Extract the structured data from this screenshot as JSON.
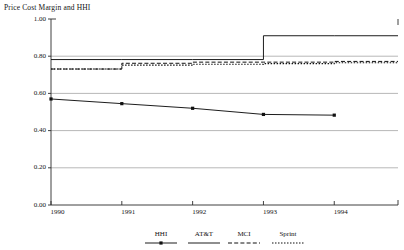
{
  "chart_data": {
    "type": "line",
    "title": "Price Cost Margin and HHI",
    "xlabel": "",
    "ylabel": "",
    "x": [
      1990,
      1991,
      1992,
      1993,
      1994
    ],
    "xlim": [
      1990,
      1994.9
    ],
    "ylim": [
      0.0,
      1.0
    ],
    "ytick_labels": [
      "0.00",
      "0.20",
      "0.40",
      "0.60",
      "0.80",
      "1.00"
    ],
    "ytick_values": [
      0.0,
      0.2,
      0.4,
      0.6,
      0.8,
      1.0
    ],
    "xtick_labels": [
      "1990",
      "1991",
      "1992",
      "1993",
      "1994"
    ],
    "xtick_values": [
      1990,
      1991,
      1992,
      1993,
      1994
    ],
    "grid": true,
    "legend_position": "bottom",
    "series": [
      {
        "name": "HHI",
        "style": "solid-markers",
        "marker": "square",
        "step": false,
        "values": [
          0.57,
          0.545,
          0.52,
          0.487,
          0.483
        ]
      },
      {
        "name": "AT&T",
        "style": "solid",
        "marker": "none",
        "step": true,
        "values": [
          0.782,
          0.782,
          0.782,
          0.91,
          0.91
        ]
      },
      {
        "name": "MCI",
        "style": "dashed",
        "marker": "none",
        "step": true,
        "values": [
          0.731,
          0.762,
          0.768,
          0.768,
          0.772
        ]
      },
      {
        "name": "Sprint",
        "style": "dotted",
        "marker": "none",
        "step": true,
        "values": [
          0.731,
          0.752,
          0.757,
          0.76,
          0.765
        ]
      }
    ],
    "legend_entries": [
      "HHI",
      "AT&T",
      "MCI",
      "Sprint"
    ]
  },
  "colors": {
    "ink": "#111111",
    "grid": "#9a9a9a",
    "axis": "#2b2b2b",
    "background": "#ffffff"
  }
}
